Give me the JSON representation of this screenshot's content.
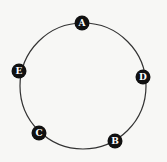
{
  "diagram": {
    "type": "ring",
    "ring": {
      "cx": 83,
      "cy": 86,
      "r": 63,
      "stroke": "#333333",
      "stroke_width": 1.2
    },
    "node_color": "#111111",
    "label_color": "#ffffff",
    "nodes": [
      {
        "id": "A",
        "label": "A",
        "x": 82,
        "y": 23
      },
      {
        "id": "D",
        "label": "D",
        "x": 143,
        "y": 77
      },
      {
        "id": "B",
        "label": "B",
        "x": 115,
        "y": 141
      },
      {
        "id": "C",
        "label": "C",
        "x": 39,
        "y": 133
      },
      {
        "id": "E",
        "label": "E",
        "x": 19,
        "y": 71
      }
    ]
  }
}
